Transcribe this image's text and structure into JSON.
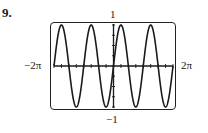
{
  "problem": {
    "number_label": "9."
  },
  "window": {
    "ymax_label": "1",
    "ymin_label": "−1",
    "xmin_label": "−2π",
    "xmax_label": "2π"
  },
  "colors": {
    "curve": "#1a1a1a",
    "axes": "#1a1a1a",
    "frame": "#222222",
    "background": "#ffffff"
  },
  "chart_data": {
    "type": "line",
    "title": "",
    "function": "y = sin(2x)",
    "xlabel": "",
    "ylabel": "",
    "xlim": [
      -6.2832,
      6.2832
    ],
    "ylim": [
      -1,
      1
    ],
    "x_tick_labels": [
      "−2π",
      "2π"
    ],
    "y_tick_labels": [
      "1",
      "−1"
    ],
    "x_tick_interval": 0.7854,
    "y_tick_interval": 0.25,
    "grid": false,
    "legend": null,
    "series": [
      {
        "name": "sin(2x)",
        "x": [
          -6.2832,
          -5.4978,
          -4.7124,
          -3.927,
          -3.1416,
          -2.3562,
          -1.5708,
          -0.7854,
          0,
          0.7854,
          1.5708,
          2.3562,
          3.1416,
          3.927,
          4.7124,
          5.4978,
          6.2832
        ],
        "values": [
          0,
          1,
          0,
          -1,
          0,
          1,
          0,
          -1,
          0,
          1,
          0,
          -1,
          0,
          1,
          0,
          -1,
          0
        ]
      }
    ],
    "key_points": {
      "maxima_x": [
        "-7π/4",
        "-3π/4",
        "π/4",
        "5π/4"
      ],
      "minima_x": [
        "-5π/4",
        "-π/4",
        "3π/4",
        "7π/4"
      ],
      "period": "π",
      "amplitude": 1
    }
  }
}
